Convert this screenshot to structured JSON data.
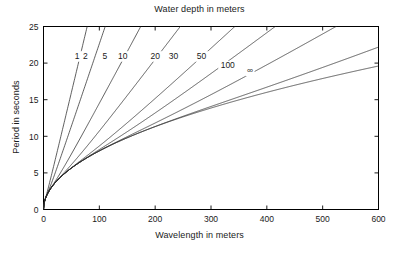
{
  "chart_data": {
    "type": "line",
    "title": "Water depth in meters",
    "xlabel": "Wavelength in meters",
    "ylabel": "Period in seconds",
    "xlim": [
      0,
      600
    ],
    "ylim": [
      0,
      25
    ],
    "xticks": [
      0,
      100,
      200,
      300,
      400,
      500,
      600
    ],
    "yticks": [
      0,
      5,
      10,
      15,
      20,
      25
    ],
    "xtick_labels": [
      "0",
      "100",
      "200",
      "300",
      "400",
      "500",
      "600"
    ],
    "ytick_labels": [
      "0",
      "5",
      "10",
      "15",
      "20",
      "25"
    ],
    "grid": false,
    "legend_position": "inline-curve-labels",
    "annotations": [
      "Curves are labelled by water depth in meters",
      "The curve marked infinity is the deep-water limit"
    ],
    "series": [
      {
        "name": "1",
        "label": "1",
        "depth_m": 1,
        "label_x": 60,
        "label_y": 20.6,
        "x": [
          0,
          5,
          10,
          20,
          30,
          40,
          50,
          60,
          70,
          80,
          90,
          100,
          110,
          120,
          130
        ],
        "y": [
          0,
          1.75,
          2.75,
          4.3,
          5.6,
          6.8,
          7.9,
          9.0,
          10.1,
          11.2,
          12.3,
          13.4,
          14.5,
          15.6,
          16.7
        ]
      },
      {
        "name": "2",
        "label": "2",
        "depth_m": 2,
        "label_x": 75,
        "label_y": 20.6,
        "x": [
          0,
          5,
          10,
          20,
          30,
          40,
          50,
          60,
          80,
          100,
          120,
          140,
          160,
          180
        ],
        "y": [
          0,
          1.62,
          2.45,
          3.65,
          4.6,
          5.45,
          6.2,
          6.9,
          8.2,
          9.5,
          10.8,
          12.1,
          13.4,
          14.7
        ]
      },
      {
        "name": "5",
        "label": "5",
        "depth_m": 5,
        "label_x": 110,
        "label_y": 20.6,
        "x": [
          0,
          10,
          20,
          30,
          40,
          60,
          80,
          100,
          130,
          160,
          200,
          240,
          280
        ],
        "y": [
          0,
          2.3,
          3.3,
          4.1,
          4.8,
          5.95,
          6.9,
          7.8,
          9.0,
          10.2,
          11.7,
          13.2,
          14.7
        ]
      },
      {
        "name": "10",
        "label": "10",
        "depth_m": 10,
        "label_x": 142,
        "label_y": 20.6,
        "x": [
          0,
          10,
          20,
          40,
          60,
          80,
          100,
          140,
          180,
          230,
          280,
          340,
          400
        ],
        "y": [
          0,
          2.4,
          3.5,
          4.9,
          5.9,
          6.7,
          7.5,
          8.7,
          9.8,
          11.1,
          12.4,
          13.9,
          15.4
        ]
      },
      {
        "name": "20",
        "label": "20",
        "depth_m": 20,
        "label_x": 200,
        "label_y": 20.6,
        "x": [
          0,
          10,
          20,
          40,
          60,
          100,
          140,
          180,
          240,
          300,
          380,
          460,
          540
        ],
        "y": [
          0,
          2.5,
          3.55,
          5.05,
          6.2,
          7.9,
          9.1,
          10.1,
          11.4,
          12.6,
          14.0,
          15.4,
          16.8
        ]
      },
      {
        "name": "30",
        "label": "30",
        "depth_m": 30,
        "label_x": 233,
        "label_y": 20.6,
        "x": [
          0,
          10,
          20,
          40,
          60,
          100,
          150,
          200,
          260,
          330,
          420,
          510,
          600
        ],
        "y": [
          0,
          2.5,
          3.55,
          5.05,
          6.2,
          8.0,
          9.6,
          10.8,
          12.0,
          13.2,
          14.7,
          16.0,
          17.4
        ]
      },
      {
        "name": "50",
        "label": "50",
        "depth_m": 50,
        "label_x": 283,
        "label_y": 20.6,
        "x": [
          0,
          10,
          20,
          40,
          80,
          120,
          180,
          240,
          320,
          400,
          500,
          600
        ],
        "y": [
          0,
          2.5,
          3.6,
          5.05,
          7.1,
          8.7,
          10.5,
          11.9,
          13.5,
          14.8,
          16.3,
          17.6
        ]
      },
      {
        "name": "100",
        "label": "100",
        "depth_m": 100,
        "label_x": 330,
        "label_y": 19.3,
        "x": [
          0,
          10,
          20,
          40,
          80,
          140,
          200,
          280,
          360,
          450,
          540,
          600
        ],
        "y": [
          0,
          2.5,
          3.6,
          5.05,
          7.15,
          9.45,
          11.2,
          13.1,
          14.8,
          16.5,
          18.0,
          19.0
        ]
      },
      {
        "name": "infinity",
        "label": "∞",
        "depth_m": null,
        "label_x": 370,
        "label_y": 18.6,
        "x": [
          0,
          10,
          20,
          40,
          80,
          140,
          200,
          280,
          360,
          450,
          540,
          600
        ],
        "y": [
          0,
          2.53,
          3.58,
          5.06,
          7.16,
          9.47,
          11.3,
          13.4,
          15.2,
          17.0,
          18.6,
          19.6
        ]
      }
    ]
  }
}
